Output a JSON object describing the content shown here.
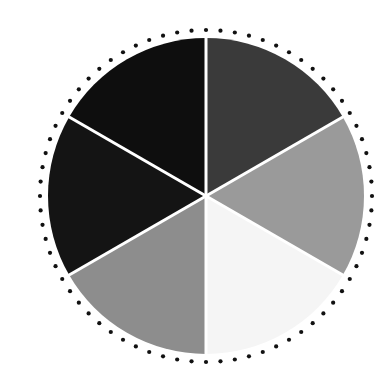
{
  "figure": {
    "background_color": "#ffffff",
    "width": 392,
    "height": 388
  },
  "chart_data": {
    "type": "pie",
    "title": "",
    "subtitle": "",
    "xlabel": "",
    "ylabel": "",
    "legend_position": "none",
    "grid": false,
    "center": {
      "x": 206,
      "y": 196
    },
    "radius": 158,
    "start_angle_deg": -90,
    "direction": "clockwise",
    "equal_slices": true,
    "slice_count": 6,
    "slice_angle_deg": 60,
    "separator": {
      "color": "#ffffff",
      "width_px": 3,
      "label": "white wedge separator"
    },
    "categories": [
      "sector-1-top",
      "sector-2-upper-right",
      "sector-3-lower-right",
      "sector-4-bottom",
      "sector-5-lower-left",
      "sector-6-upper-left"
    ],
    "values": [
      60,
      60,
      60,
      60,
      60,
      60
    ],
    "percentages": [
      "16.7%",
      "16.7%",
      "16.7%",
      "16.7%",
      "16.7%",
      "16.7%"
    ],
    "slices": [
      {
        "name": "sector-1-top",
        "color": "#3a3a3a",
        "tone": "dark gray",
        "start_deg": -90,
        "end_deg": -30,
        "value": 60
      },
      {
        "name": "sector-2-upper-right",
        "color": "#9a9a9a",
        "tone": "medium gray",
        "start_deg": -30,
        "end_deg": 30,
        "value": 60
      },
      {
        "name": "sector-3-lower-right",
        "color": "#f5f5f5",
        "tone": "near white",
        "start_deg": 30,
        "end_deg": 90,
        "value": 60
      },
      {
        "name": "sector-4-bottom",
        "color": "#8d8d8d",
        "tone": "medium dark gray",
        "start_deg": 90,
        "end_deg": 150,
        "value": 60
      },
      {
        "name": "sector-5-lower-left",
        "color": "#141414",
        "tone": "near black",
        "start_deg": 150,
        "end_deg": 210,
        "value": 60
      },
      {
        "name": "sector-6-upper-left",
        "color": "#0e0e0e",
        "tone": "black",
        "start_deg": 210,
        "end_deg": 270,
        "value": 60
      }
    ],
    "annotations": [
      {
        "name": "dotted-outer-ring",
        "kind": "ring-of-dots",
        "dot_count": 72,
        "dot_radius_px": 2.1,
        "ring_radius_px": 166,
        "color": "#111111",
        "label": "dotted circular border"
      }
    ]
  }
}
